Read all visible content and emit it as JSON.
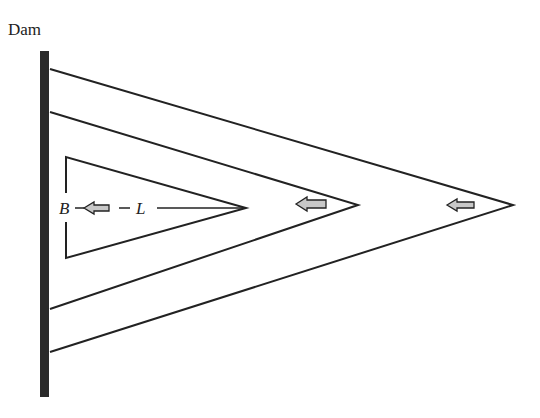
{
  "title": "Dam",
  "labels": {
    "width": "B",
    "length": "L"
  },
  "colors": {
    "line": "#222222",
    "dam": "#2a2a2a",
    "arrow_fill": "#c8c8c8",
    "background": "#ffffff"
  },
  "shapes": {
    "dam": {
      "x": 40,
      "y": 51,
      "width": 9,
      "height": 346
    },
    "triangles": [
      {
        "name": "outer",
        "top": [
          50,
          69
        ],
        "apex": [
          513,
          205
        ],
        "bottom": [
          50,
          352
        ]
      },
      {
        "name": "middle",
        "top": [
          50,
          112
        ],
        "apex": [
          358,
          205
        ],
        "bottom": [
          50,
          309
        ]
      },
      {
        "name": "inner",
        "top": [
          66,
          157
        ],
        "apex": [
          246,
          208
        ],
        "bottom": [
          66,
          258
        ]
      }
    ],
    "arrows": [
      {
        "name": "flow-arrow-inner",
        "x": 92,
        "y": 208
      },
      {
        "name": "flow-arrow-middle",
        "x": 298,
        "y": 204
      },
      {
        "name": "flow-arrow-outer",
        "x": 448,
        "y": 205
      }
    ]
  }
}
